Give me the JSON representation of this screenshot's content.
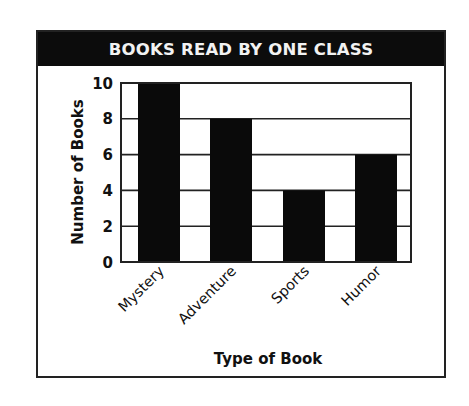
{
  "chart_data": {
    "type": "bar",
    "title": "BOOKS READ BY ONE CLASS",
    "categories": [
      "Mystery",
      "Adventure",
      "Sports",
      "Humor"
    ],
    "values": [
      10,
      8,
      4,
      6
    ],
    "xlabel": "Type of Book",
    "ylabel": "Number of Books",
    "ylim": [
      0,
      10
    ],
    "yticks": [
      0,
      2,
      4,
      6,
      8,
      10
    ],
    "grid": true,
    "legend": null,
    "bar_color": "#0a0a0a"
  }
}
